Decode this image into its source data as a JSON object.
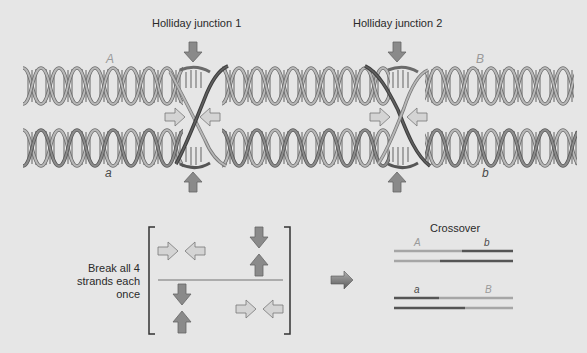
{
  "figure": {
    "title_junction_1": "Holliday junction 1",
    "title_junction_2": "Holliday junction 2",
    "helix_labels": {
      "top_left": "A",
      "top_right": "B",
      "bottom_left": "a",
      "bottom_right": "b"
    },
    "break_note": {
      "line1": "Break all 4",
      "line2": "strands each",
      "line3": "once"
    },
    "crossover": {
      "title": "Crossover",
      "product1": {
        "left_label": "A",
        "right_label": "b"
      },
      "product2": {
        "left_label": "a",
        "right_label": "B"
      }
    }
  },
  "colors": {
    "background": "#e6e6e6",
    "light_strand": "#a6a6a6",
    "dark_strand": "#555555",
    "arrow_dark": "#8a8a8a",
    "arrow_light": "#d4d4d4",
    "arrow_outline": "#666666",
    "bracket": "#333333"
  }
}
